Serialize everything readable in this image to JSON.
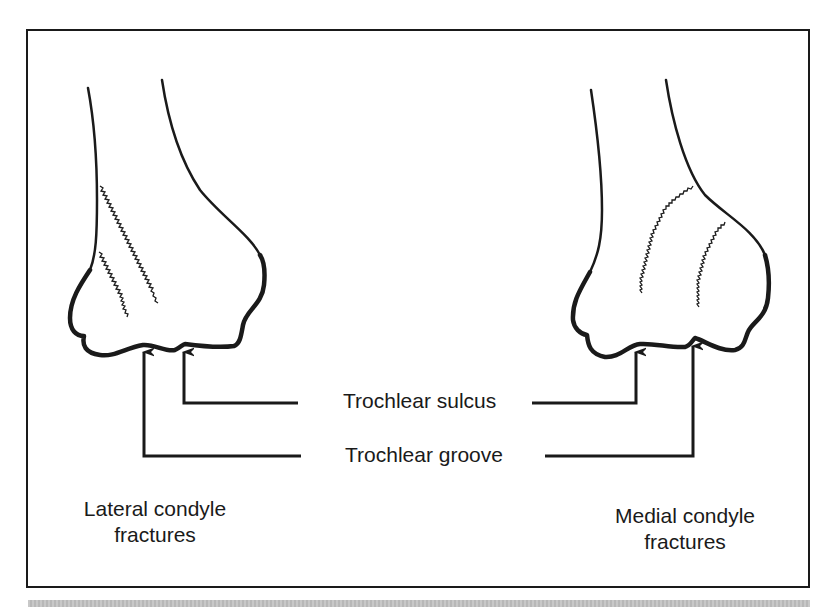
{
  "diagram": {
    "labels": {
      "sulcus": "Trochlear sulcus",
      "groove": "Trochlear groove"
    },
    "left_panel": {
      "caption_line1": "Lateral condyle",
      "caption_line2": "fractures"
    },
    "right_panel": {
      "caption_line1": "Medial condyle",
      "caption_line2": "fractures"
    },
    "colors": {
      "ink": "#1a1a1a",
      "frame": "#1a1a1a",
      "background": "#ffffff",
      "bottom_band": "#c0c0c0"
    }
  }
}
